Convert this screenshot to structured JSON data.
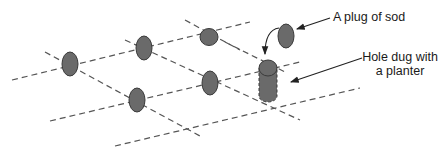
{
  "diagram": {
    "colors": {
      "plug_fill": "#6a6a6a",
      "plug_stroke": "#3a3a3a",
      "grid_line": "#555555",
      "arrow": "#222222",
      "background": "#ffffff"
    },
    "labels": {
      "plug": "A plug of sod",
      "hole_line1": "Hole dug with",
      "hole_line2": "a planter"
    },
    "grid_lines": [
      {
        "x1": 12,
        "y1": 80,
        "x2": 250,
        "y2": 22
      },
      {
        "x1": 50,
        "y1": 121,
        "x2": 300,
        "y2": 62
      },
      {
        "x1": 115,
        "y1": 146,
        "x2": 360,
        "y2": 88
      },
      {
        "x1": 45,
        "y1": 52,
        "x2": 200,
        "y2": 136
      },
      {
        "x1": 125,
        "y1": 40,
        "x2": 300,
        "y2": 120
      },
      {
        "x1": 185,
        "y1": 20,
        "x2": 240,
        "y2": 50
      },
      {
        "x1": 225,
        "y1": 42,
        "x2": 280,
        "y2": 70
      }
    ],
    "plugs": [
      {
        "id": "plug-1",
        "cx": 70,
        "cy": 64,
        "rx": 8,
        "ry": 12
      },
      {
        "id": "plug-2",
        "cx": 144,
        "cy": 48,
        "rx": 8,
        "ry": 12
      },
      {
        "id": "plug-3",
        "cx": 209,
        "cy": 37,
        "rx": 9,
        "ry": 8.5
      },
      {
        "id": "plug-4",
        "cx": 137,
        "cy": 100,
        "rx": 8,
        "ry": 12
      },
      {
        "id": "plug-5",
        "cx": 210,
        "cy": 83,
        "rx": 8,
        "ry": 12
      }
    ],
    "raised_plug": {
      "cx": 286,
      "cy": 36,
      "rx": 8,
      "ry": 12
    },
    "hole": {
      "cx": 268,
      "top_cy": 68,
      "rx": 9,
      "ry": 8,
      "bottom_y": 100
    }
  }
}
